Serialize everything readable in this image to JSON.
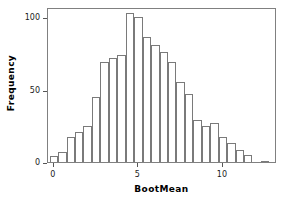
{
  "chart_data": {
    "type": "bar",
    "title": "",
    "subtitle": "",
    "xlabel": "BootMean",
    "ylabel": "Frequency",
    "xlim": [
      -0.35,
      13.2
    ],
    "ylim": [
      0,
      107
    ],
    "grid": false,
    "legend": null,
    "bin_width": 0.5,
    "x_ticks": [
      {
        "value": 0,
        "label": "0"
      },
      {
        "value": 5,
        "label": "5"
      },
      {
        "value": 10,
        "label": "10"
      }
    ],
    "y_ticks": [
      {
        "value": 0,
        "label": "0"
      },
      {
        "value": 50,
        "label": "50"
      },
      {
        "value": 100,
        "label": "100"
      }
    ],
    "bin_starts": [
      -0.25,
      0.25,
      0.75,
      1.25,
      1.75,
      2.25,
      2.75,
      3.25,
      3.75,
      4.25,
      4.75,
      5.25,
      5.75,
      6.25,
      6.75,
      7.25,
      7.75,
      8.25,
      8.75,
      9.25,
      9.75,
      10.25,
      10.75,
      11.25,
      12.25
    ],
    "categories": [
      "-0.25",
      "0.25",
      "0.75",
      "1.25",
      "1.75",
      "2.25",
      "2.75",
      "3.25",
      "3.75",
      "4.25",
      "4.75",
      "5.25",
      "5.75",
      "6.25",
      "6.75",
      "7.25",
      "7.75",
      "8.25",
      "8.75",
      "9.25",
      "9.75",
      "10.25",
      "10.75",
      "11.25",
      "12.25"
    ],
    "values": [
      4,
      7,
      17,
      21,
      25,
      45,
      69,
      72,
      74,
      103,
      100,
      86,
      81,
      76,
      69,
      55,
      47,
      29,
      25,
      27,
      17,
      13,
      8,
      5,
      1
    ],
    "bar_edge_color": "#7a7a7a",
    "bar_fill_color": "#ffffff",
    "frame_color": "#808080",
    "axis_text_color": "#1a1a1a"
  }
}
